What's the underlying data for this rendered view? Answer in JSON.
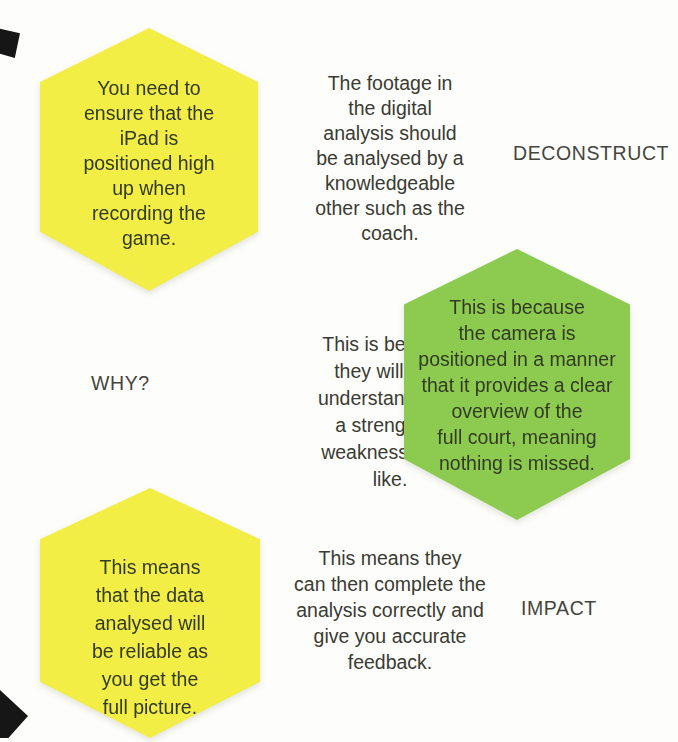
{
  "page": {
    "background": "#fdfdfb",
    "corner_mark_color": "#161616",
    "ink": "#3a3b33",
    "hex_ink": "#333a24",
    "label_ink": "#45453e",
    "yellow": "#f2ee45",
    "green": "#8ccb4f"
  },
  "rows": [
    {
      "hexagon": {
        "fill": "yellow",
        "lines": [
          "You need to",
          "ensure that the",
          "iPad is",
          "positioned high",
          "up when",
          "recording the",
          "game."
        ]
      },
      "note": {
        "lines": [
          "The footage in",
          "the digital",
          "analysis should",
          "be analysed by a",
          "knowledgeable",
          "other such as the",
          "coach."
        ]
      },
      "label": "DECONSTRUCT"
    },
    {
      "label": "WHY?",
      "note": {
        "lines": [
          "This is because",
          "they will truly",
          "understand what",
          "a strength or",
          "weakness looks",
          "like."
        ]
      },
      "hexagon": {
        "fill": "green",
        "lines": [
          "This is because",
          "the camera is",
          "positioned in a manner",
          "that it provides a clear",
          "overview of the",
          "full court, meaning",
          "nothing is missed."
        ]
      }
    },
    {
      "hexagon": {
        "fill": "yellow",
        "lines": [
          "This means",
          "that the data",
          "analysed will",
          "be reliable as",
          "you get the",
          "full picture."
        ]
      },
      "note": {
        "lines": [
          "This means they",
          "can then complete the",
          "analysis correctly and",
          "give you accurate",
          "feedback."
        ]
      },
      "label": "IMPACT"
    }
  ]
}
